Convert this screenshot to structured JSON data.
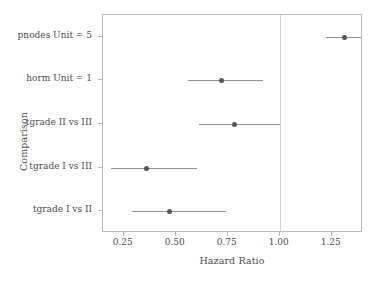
{
  "chart_data": {
    "type": "scatter",
    "subtype": "forest-plot",
    "title": "",
    "xlabel": "Hazard Ratio",
    "ylabel": "Comparison",
    "xlim": [
      0.15,
      1.4
    ],
    "ylim": [
      0,
      5
    ],
    "grid": false,
    "legend": null,
    "reference_line": {
      "x": 1.0,
      "label": "1.00",
      "color": "#d4d4d4"
    },
    "xticks": [
      0.25,
      0.5,
      0.75,
      1.0,
      1.25
    ],
    "xticklabels": [
      "0.25",
      "0.50",
      "0.75",
      "1.00",
      "1.25"
    ],
    "categories": [
      "pnodes Unit = 5",
      "horm Unit = 1",
      "tgrade II vs III",
      "tgrade I vs III",
      "tgrade I vs II"
    ],
    "point_color": "#55555c",
    "bar_color": "#8f8f94",
    "points": [
      {
        "label": "pnodes Unit = 5",
        "estimate": 1.31,
        "ci_low": 1.22,
        "ci_high": 1.39
      },
      {
        "label": "horm Unit = 1",
        "estimate": 0.72,
        "ci_low": 0.56,
        "ci_high": 0.92
      },
      {
        "label": "tgrade II vs III",
        "estimate": 0.78,
        "ci_low": 0.61,
        "ci_high": 1.0
      },
      {
        "label": "tgrade I vs III",
        "estimate": 0.36,
        "ci_low": 0.19,
        "ci_high": 0.6
      },
      {
        "label": "tgrade I vs II",
        "estimate": 0.47,
        "ci_low": 0.29,
        "ci_high": 0.74
      }
    ]
  }
}
